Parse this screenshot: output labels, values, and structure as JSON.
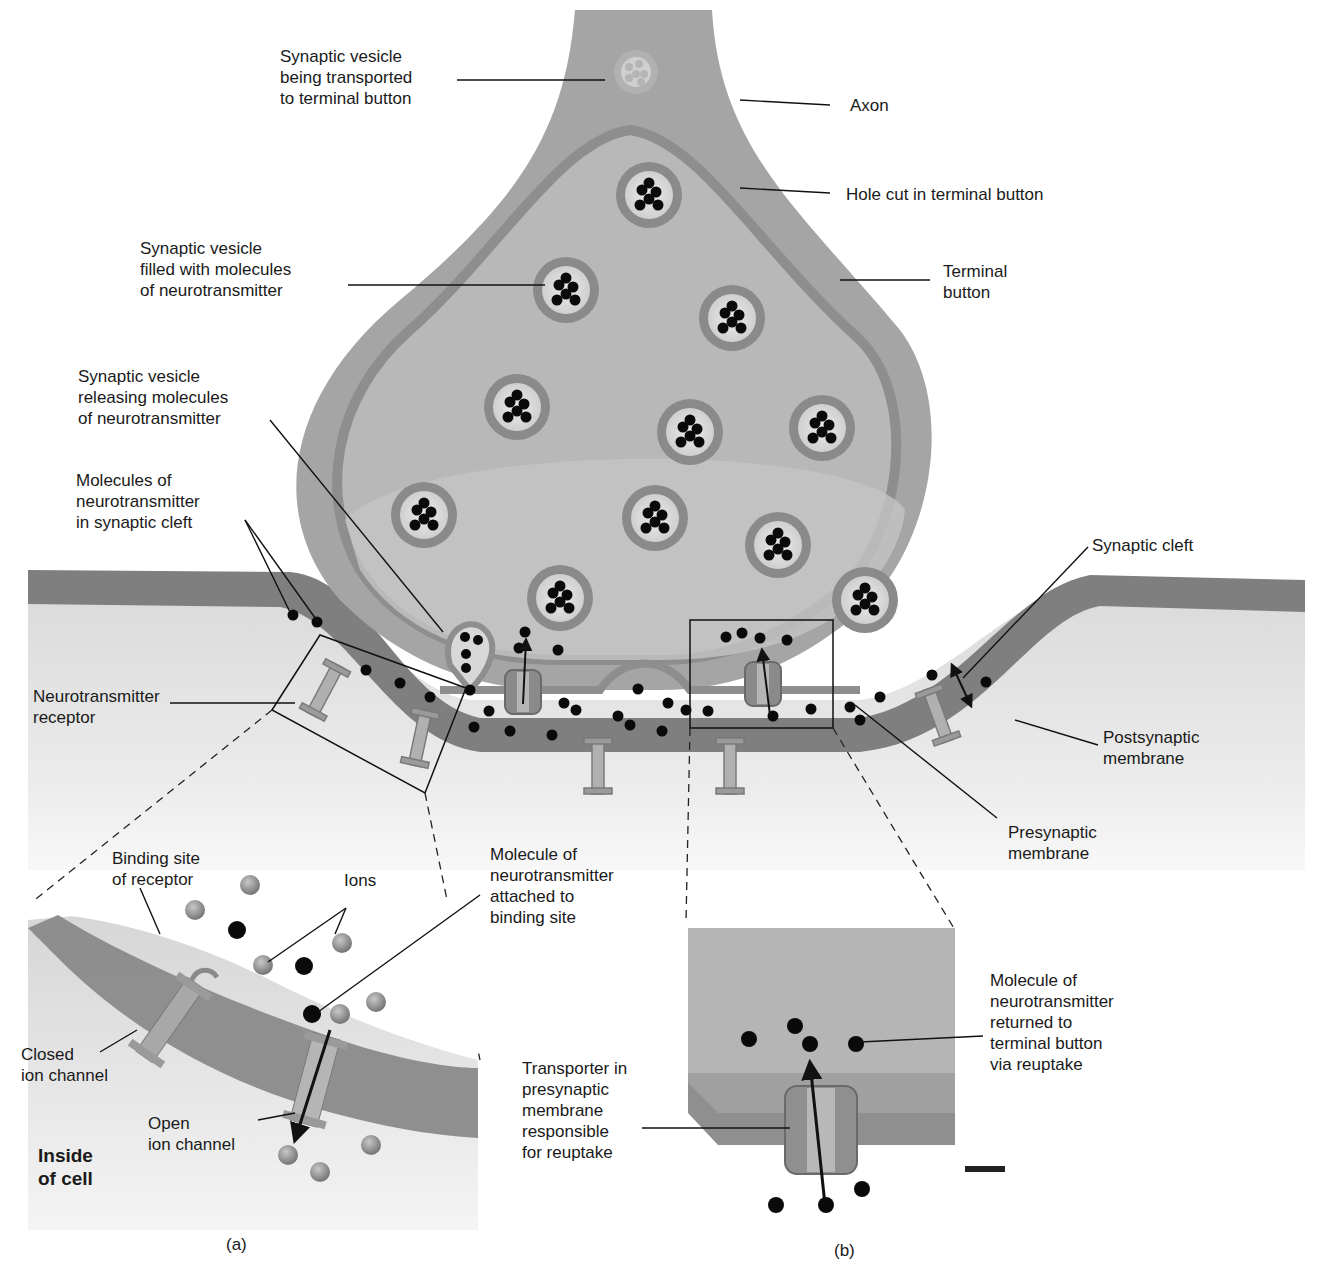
{
  "figure": {
    "panels": [
      {
        "id": "a",
        "caption": "(a)"
      },
      {
        "id": "b",
        "caption": "(b)"
      }
    ]
  },
  "labels": {
    "vesicle_transported": "Synaptic vesicle\nbeing transported\nto terminal button",
    "axon": "Axon",
    "hole_cut": "Hole cut in terminal button",
    "vesicle_filled": "Synaptic vesicle\nfilled with molecules\nof neurotransmitter",
    "terminal_button": "Terminal\nbutton",
    "vesicle_releasing": "Synaptic vesicle\nreleasing molecules\nof neurotransmitter",
    "molecules_in_cleft": "Molecules of\nneurotransmitter\nin synaptic cleft",
    "synaptic_cleft": "Synaptic cleft",
    "nt_receptor": "Neurotransmitter\nreceptor",
    "postsynaptic_membrane": "Postsynaptic\nmembrane",
    "presynaptic_membrane": "Presynaptic\nmembrane",
    "binding_site": "Binding site\nof receptor",
    "ions": "Ions",
    "molecule_attached": "Molecule of\nneurotransmitter\nattached to\nbinding site",
    "closed_channel": "Closed\nion channel",
    "open_channel": "Open\nion channel",
    "inside_cell": "Inside\nof cell",
    "transporter": "Transporter in\npresynaptic\nmembrane\nresponsible\nfor reuptake",
    "molecule_returned": "Molecule of\nneurotransmitter\nreturned to\nterminal button\nvia reuptake"
  },
  "colors": {
    "tissue": "#a9a9a9",
    "tissue_dark": "#8e8e8e",
    "membrane": "#7f7f7f",
    "cell_interior": "#e2e2e2",
    "vesicle_ring": "#8a8a8a",
    "vesicle_core": "#dcdcdc",
    "molecule": "#0a0a0a",
    "ion": "#8c8c8c",
    "label_text": "#1a1a1a"
  }
}
